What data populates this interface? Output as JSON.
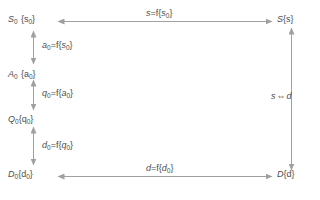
{
  "diagram": {
    "background_color": "#ffffff",
    "line_color": "#a0a0a0",
    "text_color": "#4d4d4d",
    "nodes": [
      {
        "id": "s0",
        "base": "S",
        "sub": "0",
        "set": "{s",
        "set_sub": "0",
        "set_close": "}",
        "text": "S0 {s0}"
      },
      {
        "id": "a0",
        "base": "A",
        "sub": "0",
        "set": "{a",
        "set_sub": "0",
        "set_close": "}",
        "text": "A0 {a0}"
      },
      {
        "id": "q0",
        "base": "Q",
        "sub": "0",
        "set": "{q",
        "set_sub": "0",
        "set_close": "}",
        "text": "Q0{q0}"
      },
      {
        "id": "d0",
        "base": "D",
        "sub": "0",
        "set": "{d",
        "set_sub": "0",
        "set_close": "}",
        "text": "D0{d0}"
      },
      {
        "id": "s",
        "base": "S",
        "sub": "",
        "set": "{s",
        "set_sub": "",
        "set_close": "}",
        "text": "S{s}"
      },
      {
        "id": "d",
        "base": "D",
        "sub": "",
        "set": "{d",
        "set_sub": "",
        "set_close": "}",
        "text": "D{d}"
      }
    ],
    "edges": [
      {
        "id": "top",
        "from": "s0",
        "to": "s",
        "orientation": "horizontal",
        "double_headed": true,
        "label": {
          "lhs": "s",
          "lhs_sub": "",
          "op": "=f{",
          "rhs": "s",
          "rhs_sub": "0",
          "close": "}",
          "text": "s=f{s0}"
        }
      },
      {
        "id": "s0-a0",
        "from": "s0",
        "to": "a0",
        "orientation": "vertical",
        "double_headed": true,
        "label": {
          "lhs": "a",
          "lhs_sub": "0",
          "op": "=f{",
          "rhs": "s",
          "rhs_sub": "0",
          "close": "}",
          "text": "a0=f{s0}"
        }
      },
      {
        "id": "a0-q0",
        "from": "a0",
        "to": "q0",
        "orientation": "vertical",
        "double_headed": true,
        "label": {
          "lhs": "q",
          "lhs_sub": "0",
          "op": "=f{",
          "rhs": "a",
          "rhs_sub": "0",
          "close": "}",
          "text": "q0=f{a0}"
        }
      },
      {
        "id": "q0-d0",
        "from": "q0",
        "to": "d0",
        "orientation": "vertical",
        "double_headed": true,
        "label": {
          "lhs": "d",
          "lhs_sub": "0",
          "op": "=f{",
          "rhs": "q",
          "rhs_sub": "0",
          "close": "}",
          "text": "d0=f{q0}"
        }
      },
      {
        "id": "bottom",
        "from": "d0",
        "to": "d",
        "orientation": "horizontal",
        "double_headed": true,
        "label": {
          "lhs": "d",
          "lhs_sub": "",
          "op": "=f{",
          "rhs": "d",
          "rhs_sub": "0",
          "close": "}",
          "text": "d=f{d0}"
        }
      },
      {
        "id": "right",
        "from": "s",
        "to": "d",
        "orientation": "vertical",
        "double_headed": true,
        "label": {
          "lhs": "s",
          "lhs_sub": "",
          "op": "⇔",
          "rhs": "d",
          "rhs_sub": "",
          "close": "",
          "text": "s ⇔ d"
        }
      }
    ]
  }
}
